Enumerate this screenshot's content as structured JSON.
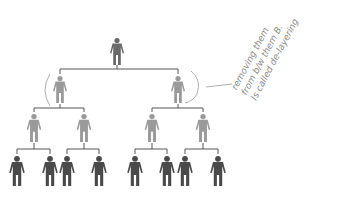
{
  "diagram": {
    "type": "family-tree",
    "colors": {
      "top": "#6a6a6a",
      "level1": "#9a9a9a",
      "level2": "#9a9a9a",
      "leaf": "#4a4a4a",
      "line": "#555555",
      "annotation": "#8a8a8a"
    },
    "nodes": {
      "root": {
        "x": 117,
        "y": 38
      },
      "level1": [
        {
          "x": 60,
          "y": 76
        },
        {
          "x": 178,
          "y": 76
        }
      ],
      "level2": [
        {
          "x": 34,
          "y": 114
        },
        {
          "x": 84,
          "y": 114
        },
        {
          "x": 152,
          "y": 114
        },
        {
          "x": 203,
          "y": 114
        }
      ],
      "leaves": [
        {
          "x": 17,
          "y": 156
        },
        {
          "x": 50,
          "y": 156
        },
        {
          "x": 67,
          "y": 156
        },
        {
          "x": 99,
          "y": 156
        },
        {
          "x": 135,
          "y": 156
        },
        {
          "x": 167,
          "y": 156
        },
        {
          "x": 185,
          "y": 156
        },
        {
          "x": 218,
          "y": 156
        }
      ]
    },
    "annotation": {
      "lines": [
        "removing them",
        "from b/w them B.",
        "Is called de-layering"
      ]
    }
  }
}
